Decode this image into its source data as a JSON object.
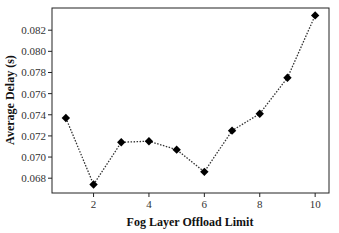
{
  "chart_data": {
    "type": "line",
    "title": "",
    "xlabel": "Fog Layer Offload Limit",
    "ylabel": "Average Delay (s)",
    "x": [
      1,
      2,
      3,
      4,
      5,
      6,
      7,
      8,
      9,
      10
    ],
    "series": [
      {
        "name": "Average Delay",
        "values": [
          0.0737,
          0.0674,
          0.0714,
          0.0715,
          0.0707,
          0.0686,
          0.0725,
          0.0741,
          0.0775,
          0.0834
        ],
        "marker": "diamond",
        "line_style": "dotted",
        "color": "#000000"
      }
    ],
    "xlim": [
      0.5,
      10.5
    ],
    "ylim": [
      0.0666,
      0.0841
    ],
    "xticks": [
      2,
      4,
      6,
      8,
      10
    ],
    "xtick_labels": [
      "2",
      "4",
      "6",
      "8",
      "10"
    ],
    "yticks": [
      0.068,
      0.07,
      0.072,
      0.074,
      0.076,
      0.078,
      0.08,
      0.082
    ],
    "ytick_labels": [
      "0.068",
      "0.070",
      "0.072",
      "0.074",
      "0.076",
      "0.078",
      "0.080",
      "0.082"
    ],
    "grid": false,
    "legend": "none"
  }
}
